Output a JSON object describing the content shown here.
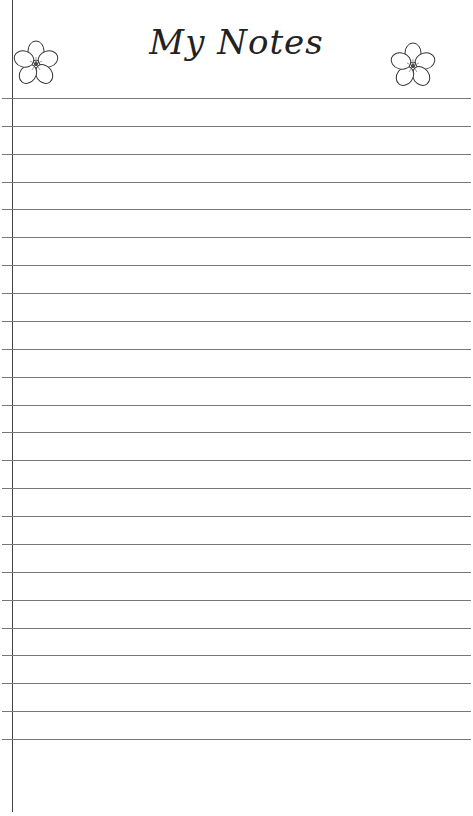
{
  "page": {
    "title": "My Notes",
    "line_color": "#777777",
    "margin_color": "#444444",
    "line_count": 24,
    "first_line_y": 98,
    "line_spacing": 27.87,
    "decorations": [
      {
        "icon": "flower-icon",
        "position": "top-left"
      },
      {
        "icon": "flower-icon",
        "position": "top-right"
      }
    ]
  }
}
